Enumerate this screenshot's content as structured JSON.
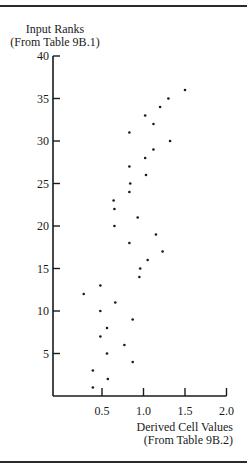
{
  "chart_data": {
    "type": "scatter",
    "title": "",
    "ylabel": "Input Ranks",
    "ylabel_sub": "(From Table 9B.1)",
    "xlabel": "Derived Cell Values",
    "xlabel_sub": "(From Table 9B.2)",
    "xlim": [
      0,
      2.0
    ],
    "ylim": [
      0,
      40
    ],
    "x_ticks": [
      "0.5",
      "1.0",
      "1.5",
      "2.0"
    ],
    "y_ticks": [
      "5",
      "10",
      "15",
      "20",
      "25",
      "30",
      "35",
      "40"
    ],
    "grid": false,
    "legend": null,
    "points": [
      {
        "x": 0.39,
        "y": 1
      },
      {
        "x": 0.57,
        "y": 2
      },
      {
        "x": 0.39,
        "y": 3
      },
      {
        "x": 0.87,
        "y": 4
      },
      {
        "x": 0.56,
        "y": 5
      },
      {
        "x": 0.77,
        "y": 6
      },
      {
        "x": 0.48,
        "y": 7
      },
      {
        "x": 0.56,
        "y": 8
      },
      {
        "x": 0.87,
        "y": 9
      },
      {
        "x": 0.48,
        "y": 10
      },
      {
        "x": 0.66,
        "y": 11
      },
      {
        "x": 0.28,
        "y": 12
      },
      {
        "x": 0.48,
        "y": 13
      },
      {
        "x": 0.95,
        "y": 14
      },
      {
        "x": 0.96,
        "y": 15
      },
      {
        "x": 1.05,
        "y": 16
      },
      {
        "x": 1.23,
        "y": 17
      },
      {
        "x": 0.83,
        "y": 18
      },
      {
        "x": 1.15,
        "y": 19
      },
      {
        "x": 0.65,
        "y": 20
      },
      {
        "x": 0.93,
        "y": 21
      },
      {
        "x": 0.65,
        "y": 22
      },
      {
        "x": 0.64,
        "y": 23
      },
      {
        "x": 0.83,
        "y": 24
      },
      {
        "x": 0.84,
        "y": 25
      },
      {
        "x": 1.03,
        "y": 26
      },
      {
        "x": 0.83,
        "y": 27
      },
      {
        "x": 1.02,
        "y": 28
      },
      {
        "x": 1.12,
        "y": 29
      },
      {
        "x": 1.32,
        "y": 30
      },
      {
        "x": 0.83,
        "y": 31
      },
      {
        "x": 1.12,
        "y": 32
      },
      {
        "x": 1.02,
        "y": 33
      },
      {
        "x": 1.2,
        "y": 34
      },
      {
        "x": 1.3,
        "y": 35
      },
      {
        "x": 1.5,
        "y": 36
      }
    ]
  },
  "colors": {
    "ink": "#1a1a1a",
    "background": "#ffffff"
  }
}
